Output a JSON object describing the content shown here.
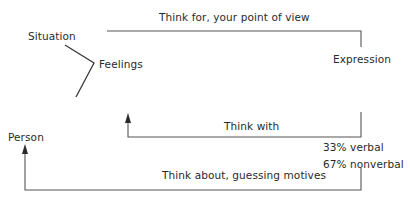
{
  "diagram": {
    "nodes": {
      "situation": "Situation",
      "feelings": "Feelings",
      "expression": "Expression",
      "person": "Person"
    },
    "edges": {
      "think_for": "Think for, your point of view",
      "think_with": "Think with",
      "think_about": "Think about, guessing motives"
    },
    "expression_breakdown": {
      "verbal": "33% verbal",
      "nonverbal": "67% nonverbal"
    },
    "colors": {
      "line": "#3a3a3a",
      "text": "#2a2a2a",
      "background": "#ffffff"
    }
  }
}
